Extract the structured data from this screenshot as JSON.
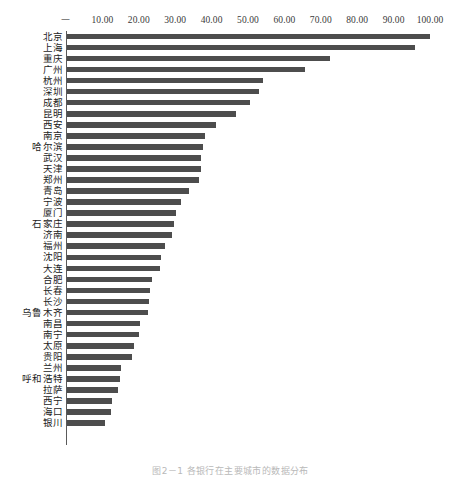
{
  "figure": {
    "caption": "图2－1  各银行在主要城市的数据分布"
  },
  "chart_data": {
    "type": "bar",
    "orientation": "horizontal",
    "title": "",
    "subtitle": "",
    "xlabel": "",
    "ylabel": "",
    "xlim": [
      0,
      100
    ],
    "grid": false,
    "legend": null,
    "legend_position": "none",
    "axis_position": "top",
    "bar_color": "#4d4d4d",
    "tick_labels": [
      "－",
      "10.00",
      "20.00",
      "30.00",
      "40.00",
      "50.00",
      "60.00",
      "70.00",
      "80.00",
      "90.00",
      "100.00"
    ],
    "tick_values": [
      0,
      10,
      20,
      30,
      40,
      50,
      60,
      70,
      80,
      90,
      100
    ],
    "categories": [
      "北京",
      "上海",
      "重庆",
      "广州",
      "杭州",
      "深圳",
      "成都",
      "昆明",
      "西安",
      "南京",
      "哈尔滨",
      "武汉",
      "天津",
      "郑州",
      "青岛",
      "宁波",
      "厦门",
      "石家庄",
      "济南",
      "福州",
      "沈阳",
      "大连",
      "合肥",
      "长春",
      "长沙",
      "乌鲁木齐",
      "南昌",
      "南宁",
      "太原",
      "贵阳",
      "兰州",
      "呼和浩特",
      "拉萨",
      "西宁",
      "海口",
      "银川"
    ],
    "values": [
      100.0,
      96.0,
      72.5,
      65.5,
      54.0,
      53.0,
      50.5,
      46.5,
      41.0,
      38.0,
      37.5,
      37.0,
      36.8,
      36.5,
      33.5,
      31.5,
      30.0,
      29.5,
      29.0,
      27.0,
      26.0,
      25.5,
      23.5,
      23.0,
      22.5,
      22.3,
      20.0,
      19.8,
      18.5,
      18.0,
      15.0,
      14.5,
      14.0,
      12.5,
      12.0,
      10.5
    ]
  }
}
